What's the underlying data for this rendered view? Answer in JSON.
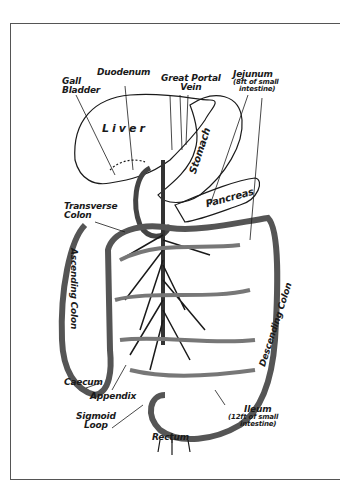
{
  "diagram": {
    "labels": {
      "gall_bladder": [
        "Gall",
        "Bladder"
      ],
      "duodenum": "Duodenum",
      "great_portal_vein": [
        "Great Portal",
        "Vein"
      ],
      "jejunum": [
        "Jejunum",
        "(8ft of small",
        "intestine)"
      ],
      "liver": "Liver",
      "stomach": "Stomach",
      "pancreas": "Pancreas",
      "transverse_colon": [
        "Transverse",
        "Colon"
      ],
      "ascending_colon": "Ascending Colon",
      "descending_colon": "Descending Colon",
      "caecum": "Caecum",
      "appendix": "Appendix",
      "sigmoid_loop": [
        "Sigmoid",
        "Loop"
      ],
      "rectum": "Rectum",
      "ileum": [
        "Ileum",
        "(12ft of small",
        "intestine)"
      ]
    },
    "colors": {
      "ink": "#1a1a1a",
      "frame": "#555555",
      "background": "#ffffff"
    }
  }
}
